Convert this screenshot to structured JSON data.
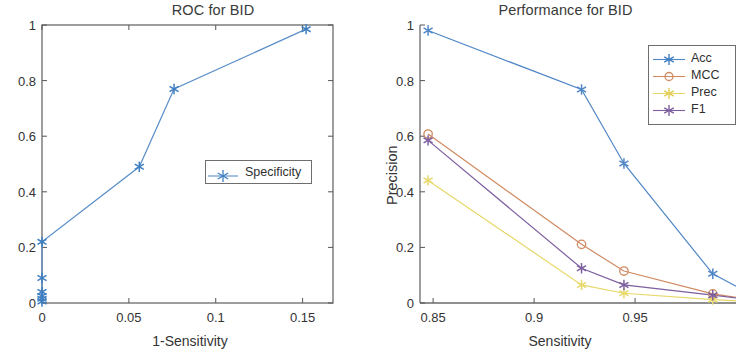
{
  "figure": {
    "panels": [
      "roc",
      "performance"
    ]
  },
  "chart_data": [
    {
      "type": "line",
      "id": "roc",
      "title": "ROC for BID",
      "xlabel": "1-Sensitivity",
      "ylabel": "",
      "xlim": [
        0,
        0.1675
      ],
      "ylim": [
        0,
        1
      ],
      "xticks": [
        0,
        0.05,
        0.1,
        0.15
      ],
      "xticklabels": [
        "0",
        "0.05",
        "0.1",
        "0.15"
      ],
      "yticks": [
        0,
        0.2,
        0.4,
        0.6,
        0.8,
        1
      ],
      "yticklabels": [
        "0",
        "0.2",
        "0.4",
        "0.6",
        "0.8",
        "1"
      ],
      "grid": false,
      "legend_position": "center-right",
      "series": [
        {
          "name": "Specificity",
          "color": "#5b8fc9",
          "marker": "asterisk",
          "x": [
            0,
            0,
            0,
            0,
            0,
            0,
            0.056,
            0.076,
            0.152
          ],
          "y": [
            0.005,
            0.012,
            0.02,
            0.03,
            0.05,
            0.09,
            0.22,
            0.49,
            0.77
          ]
        }
      ],
      "points": [
        {
          "x": 0,
          "y": 0.005
        },
        {
          "x": 0,
          "y": 0.015
        },
        {
          "x": 0,
          "y": 0.025
        },
        {
          "x": 0,
          "y": 0.04
        },
        {
          "x": 0,
          "y": 0.09
        },
        {
          "x": 0,
          "y": 0.22
        },
        {
          "x": 0.056,
          "y": 0.49
        },
        {
          "x": 0.076,
          "y": 0.77
        },
        {
          "x": 0.152,
          "y": 0.985
        }
      ]
    },
    {
      "type": "line",
      "id": "performance",
      "title": "Performance for BID",
      "xlabel": "Sensitivity",
      "ylabel": "Precision",
      "xlim": [
        0.8435,
        1.0
      ],
      "ylim": [
        0,
        1
      ],
      "xticks": [
        0.85,
        0.9,
        0.95
      ],
      "xticklabels": [
        "0.85",
        "0.9",
        "0.95"
      ],
      "yticks": [
        0,
        0.2,
        0.4,
        0.6,
        0.8,
        1
      ],
      "yticklabels": [
        "0",
        "0.2",
        "0.4",
        "0.6",
        "0.8",
        "1"
      ],
      "grid": false,
      "legend_position": "top-right",
      "x": [
        0.8475,
        0.9235,
        0.9445,
        0.9885,
        1.0
      ],
      "series": [
        {
          "name": "Acc",
          "color": "#4f86c6",
          "marker": "asterisk",
          "values": [
            0.98,
            0.768,
            0.502,
            0.105,
            0.06
          ]
        },
        {
          "name": "MCC",
          "color": "#d08a62",
          "marker": "circle",
          "values": [
            0.608,
            0.211,
            0.115,
            0.033,
            0.02
          ]
        },
        {
          "name": "Prec",
          "color": "#e8d86a",
          "marker": "asterisk",
          "values": [
            0.441,
            0.065,
            0.035,
            0.012,
            0.008
          ]
        },
        {
          "name": "F1",
          "color": "#7d5f9e",
          "marker": "asterisk",
          "values": [
            0.585,
            0.125,
            0.065,
            0.028,
            0.018
          ]
        }
      ]
    }
  ]
}
